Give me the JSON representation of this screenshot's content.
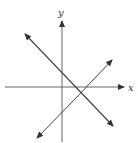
{
  "diagram": {
    "type": "coordinate-plane-two-lines",
    "axes": {
      "x_label": "x",
      "y_label": "y",
      "color": "#555555"
    },
    "lines": [
      {
        "name": "decreasing-line",
        "slope_sign": "negative",
        "from": [
          25,
          34
        ],
        "to": [
          113,
          126
        ],
        "color": "#444444"
      },
      {
        "name": "increasing-line",
        "slope_sign": "positive",
        "from": [
          37,
          138
        ],
        "to": [
          112,
          60
        ],
        "color": "#444444"
      }
    ]
  }
}
